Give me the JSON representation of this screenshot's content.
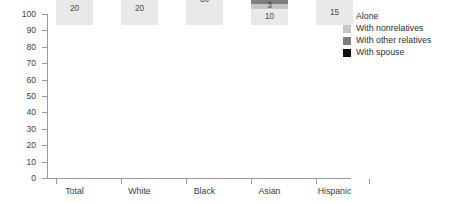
{
  "chart_data": {
    "type": "bar",
    "subtype": "stacked-bar-100",
    "title": "",
    "xlabel": "",
    "ylabel": "",
    "ylim": [
      0,
      100
    ],
    "yticks": [
      0,
      10,
      20,
      30,
      40,
      50,
      60,
      70,
      80,
      90,
      100
    ],
    "grid": false,
    "legend_position": "right",
    "categories": [
      "Total",
      "White",
      "Black",
      "Asian",
      "Hispanic"
    ],
    "series": [
      {
        "name": "Alone",
        "color": "#e9e9e9",
        "values": [
          20,
          20,
          30,
          10,
          15
        ],
        "labels": [
          "20",
          "20",
          "30",
          "10",
          "15"
        ]
      },
      {
        "name": "With nonrelatives",
        "color": "#c6c6c6",
        "values": [
          4,
          3,
          6,
          3,
          5
        ],
        "labels": [
          "4",
          "3",
          "6",
          "3",
          "5"
        ]
      },
      {
        "name": "With other relatives",
        "color": "#7f7f7f",
        "values": [
          6,
          4,
          14,
          10,
          13
        ],
        "labels": [
          "6",
          "4",
          "14",
          "10",
          "13"
        ]
      },
      {
        "name": "With spouse",
        "color": "#101010",
        "values": [
          70,
          72,
          50,
          78,
          67
        ],
        "labels": [
          "70",
          "72",
          "50",
          "78",
          "67"
        ]
      }
    ]
  },
  "axis": {
    "y_tick_labels": [
      "100",
      "90",
      "80",
      "70",
      "60",
      "50",
      "40",
      "30",
      "20",
      "10",
      "0"
    ]
  },
  "legend": {
    "items": [
      {
        "label": "Alone",
        "color": "#e9e9e9"
      },
      {
        "label": "With nonrelatives",
        "color": "#c6c6c6"
      },
      {
        "label": "With other relatives",
        "color": "#7f7f7f"
      },
      {
        "label": "With spouse",
        "color": "#101010"
      }
    ]
  },
  "colors": {
    "axis": "#9a9a9a",
    "text": "#3d3d3d",
    "background": "#ffffff"
  }
}
